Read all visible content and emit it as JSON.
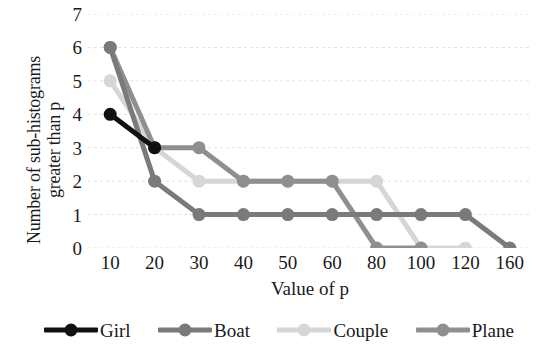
{
  "chart_data": {
    "type": "line",
    "title": "",
    "xlabel": "Value of p",
    "ylabel_line1": "Number of sub-histograms",
    "ylabel_line2": "greater than p",
    "categories": [
      "10",
      "20",
      "30",
      "40",
      "50",
      "60",
      "80",
      "100",
      "120",
      "160"
    ],
    "x": [
      10,
      20,
      30,
      40,
      50,
      60,
      80,
      100,
      120,
      160
    ],
    "ylim": [
      0,
      7
    ],
    "yticks": [
      0,
      1,
      2,
      3,
      4,
      5,
      6,
      7
    ],
    "grid": "horizontal",
    "legend_position": "bottom",
    "series": [
      {
        "name": "Girl",
        "color": "#111111",
        "values": [
          4,
          3,
          null,
          null,
          null,
          null,
          null,
          null,
          null,
          null
        ]
      },
      {
        "name": "Boat",
        "color": "#7a7a7a",
        "values": [
          6,
          2,
          1,
          1,
          1,
          1,
          1,
          1,
          1,
          0
        ]
      },
      {
        "name": "Couple",
        "color": "#d6d6d6",
        "values": [
          5,
          3,
          2,
          2,
          2,
          2,
          2,
          0,
          0,
          null
        ]
      },
      {
        "name": "Plane",
        "color": "#8f8f8f",
        "values": [
          6,
          3,
          3,
          2,
          2,
          2,
          0,
          0,
          null,
          null
        ]
      }
    ]
  },
  "axes": {
    "x_tick_labels": [
      "10",
      "20",
      "30",
      "40",
      "50",
      "60",
      "80",
      "100",
      "120",
      "160"
    ],
    "y_tick_labels": [
      "7",
      "6",
      "5",
      "4",
      "3",
      "2",
      "1",
      "0"
    ]
  },
  "legend": {
    "items": [
      {
        "label": "Girl",
        "color": "#111111"
      },
      {
        "label": "Boat",
        "color": "#7a7a7a"
      },
      {
        "label": "Couple",
        "color": "#d6d6d6"
      },
      {
        "label": "Plane",
        "color": "#8f8f8f"
      }
    ]
  },
  "style": {
    "gridline_color": "#e2e2e2",
    "background": "#ffffff",
    "text_color": "#1a1a1a"
  }
}
